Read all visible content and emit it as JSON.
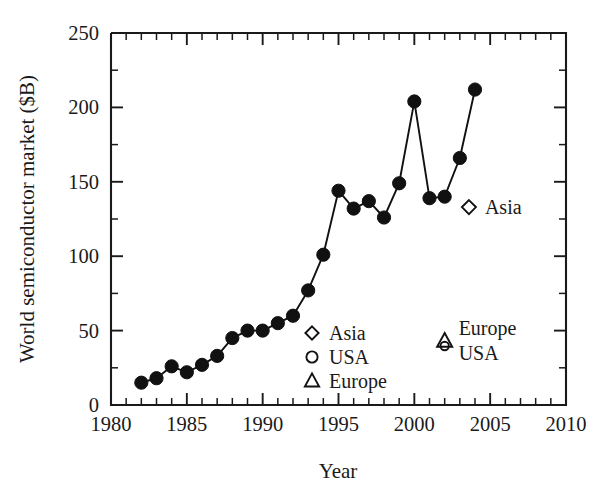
{
  "chart_data": {
    "type": "line",
    "title": "",
    "xlabel": "Year",
    "ylabel": "World semiconductor market ($B)",
    "xlim": [
      1980,
      2010
    ],
    "ylim": [
      0,
      250
    ],
    "xticks": [
      1980,
      1985,
      1990,
      1995,
      2000,
      2005,
      2010
    ],
    "xtick_labels": [
      "1980",
      "1985",
      "1990",
      "1995",
      "2000",
      "2005",
      "2010"
    ],
    "yticks": [
      0,
      50,
      100,
      150,
      200,
      250
    ],
    "ytick_labels": [
      "0",
      "50",
      "100",
      "150",
      "200",
      "250"
    ],
    "x_minor_interval": 1,
    "y_minor_interval": 25,
    "grid": false,
    "legend_position": "inside-center-lower",
    "series": [
      {
        "name": "World total",
        "marker": "filled-circle",
        "line": true,
        "x": [
          1982,
          1983,
          1984,
          1985,
          1986,
          1987,
          1988,
          1989,
          1990,
          1991,
          1992,
          1993,
          1994,
          1995,
          1996,
          1997,
          1998,
          1999,
          2000,
          2001,
          2002,
          2003,
          2004
        ],
        "values": [
          15,
          18,
          26,
          22,
          27,
          33,
          45,
          50,
          50,
          55,
          60,
          77,
          101,
          144,
          132,
          137,
          126,
          149,
          204,
          139,
          140,
          166,
          212
        ]
      }
    ],
    "legend": [
      {
        "label": "Asia",
        "marker": "diamond"
      },
      {
        "label": "USA",
        "marker": "circle"
      },
      {
        "label": "Europe",
        "marker": "triangle"
      }
    ],
    "annotations": [
      {
        "label": "Asia",
        "marker": "diamond",
        "x": 2003.6,
        "y": 133
      },
      {
        "label": "Europe",
        "marker": "triangle",
        "x": 2002.0,
        "y": 43
      },
      {
        "label": "USA",
        "marker": "circle",
        "x": 2002.0,
        "y": 41
      }
    ]
  },
  "colors": {
    "ink": "#1a1a1a",
    "marker": "#111111",
    "background": "#ffffff"
  }
}
